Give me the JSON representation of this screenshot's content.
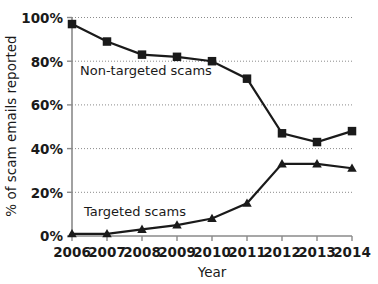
{
  "chart_data": {
    "type": "line",
    "title": "",
    "xlabel": "Year",
    "ylabel": "% of scam emails reported",
    "categories": [
      "2006",
      "2007",
      "2008",
      "2009",
      "2010",
      "2011",
      "2012",
      "2013",
      "2014"
    ],
    "x": [
      2006,
      2007,
      2008,
      2009,
      2010,
      2011,
      2012,
      2013,
      2014
    ],
    "series": [
      {
        "name": "Non-targeted scams",
        "marker": "square",
        "color": "#1a1a1a",
        "values": [
          97,
          89,
          83,
          82,
          80,
          72,
          47,
          43,
          48
        ]
      },
      {
        "name": "Targeted scams",
        "marker": "triangle",
        "color": "#1a1a1a",
        "values": [
          1,
          1,
          3,
          5,
          8,
          15,
          33,
          33,
          31
        ]
      }
    ],
    "ylim": [
      0,
      100
    ],
    "yticks": [
      0,
      20,
      40,
      60,
      80,
      100
    ],
    "ytick_labels": [
      "0%",
      "20%",
      "40%",
      "60%",
      "80%",
      "100%"
    ],
    "xlim": [
      2006,
      2014
    ],
    "grid": "horizontal-dotted",
    "legend_position": "inline-annotations",
    "annotations": [
      {
        "text": "Non-targeted scams",
        "x": 2006.55,
        "y": 78
      },
      {
        "text": "Targeted scams",
        "x": 2006.6,
        "y": 11
      }
    ]
  },
  "axes": {
    "y_title": "% of scam emails reported",
    "x_title": "Year",
    "y_tick_labels": [
      "100%",
      "80%",
      "60%",
      "40%",
      "20%",
      "0%"
    ],
    "x_tick_labels": [
      "2006",
      "2007",
      "2008",
      "2009",
      "2010",
      "2011",
      "2012",
      "2013",
      "2014"
    ]
  },
  "labels": {
    "non_targeted": "Non-targeted scams",
    "targeted": "Targeted scams"
  },
  "colors": {
    "ink": "#1a1a1a",
    "axis": "#8a8a8a",
    "grid": "#8a8a8a",
    "background": "#ffffff"
  }
}
